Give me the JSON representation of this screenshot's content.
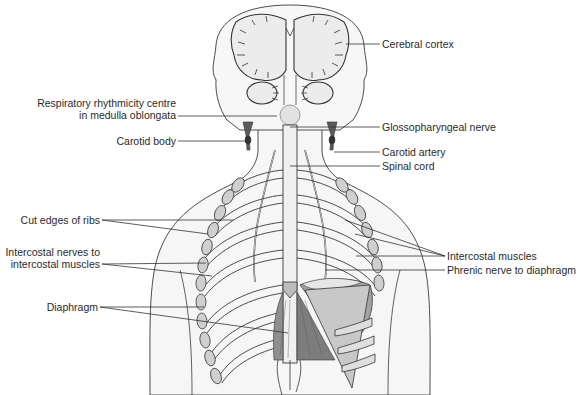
{
  "figure": {
    "colors": {
      "outline": "#3a3a3a",
      "skin_fill": "#f4f4f4",
      "brain_fill": "#ededed",
      "muscle_fill": "#8c8c8c",
      "tendon_fill": "#c4c4c4",
      "carotid_fill": "#5a5a5a",
      "leader_line": "#333333",
      "text": "#2a2a2a"
    }
  },
  "labels": {
    "left": [
      {
        "id": "respiratory_centre_line1",
        "text": "Respiratory rhythmicity centre"
      },
      {
        "id": "respiratory_centre_line2",
        "text": "in medulla oblongata"
      },
      {
        "id": "carotid_body",
        "text": "Carotid body"
      },
      {
        "id": "cut_edges_ribs",
        "text": "Cut edges of ribs"
      },
      {
        "id": "intercostal_nerves_line1",
        "text": "Intercostal nerves to"
      },
      {
        "id": "intercostal_nerves_line2",
        "text": "intercostal muscles"
      },
      {
        "id": "diaphragm",
        "text": "Diaphragm"
      }
    ],
    "right": [
      {
        "id": "cerebral_cortex",
        "text": "Cerebral cortex"
      },
      {
        "id": "glossopharyngeal_nerve",
        "text": "Glossopharyngeal nerve"
      },
      {
        "id": "carotid_artery",
        "text": "Carotid artery"
      },
      {
        "id": "spinal_cord",
        "text": "Spinal cord"
      },
      {
        "id": "intercostal_muscles",
        "text": "Intercostal muscles"
      },
      {
        "id": "phrenic_nerve",
        "text": "Phrenic nerve to diaphragm"
      }
    ]
  }
}
